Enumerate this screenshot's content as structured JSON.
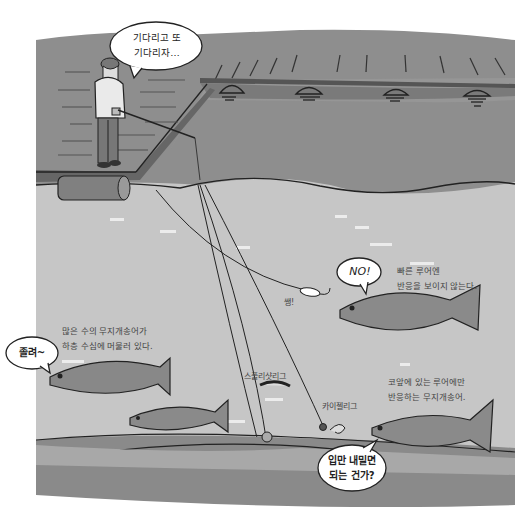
{
  "illustration": {
    "title": "무지개송어 루어 낚시 일러스트",
    "colors": {
      "background": "#ffffff",
      "sky_gray": "#8e8e8e",
      "dock_surface": "#9a9a9a",
      "dock_edge": "#777777",
      "water_light": "#c4c4c4",
      "water_deep": "#888888",
      "bottom_band": "#a9a9a9",
      "line": "#2a2a2a",
      "bubble_fill": "#ffffff",
      "text": "#333333"
    },
    "speech_bubbles": {
      "angler": {
        "line1": "기다리고 또",
        "line2": "기다리자…"
      },
      "refusing_trout": "NO!",
      "sleepy_trout": "졸려~",
      "mouth_bubble": {
        "line1": "입만 내밀면",
        "line2": "되는 건가?"
      }
    },
    "captions": {
      "fast_lure": {
        "line1": "빠른 루어엔",
        "line2": "반응을 보이지 않는다."
      },
      "many_trout": {
        "line1": "많은 수의 무지개송어가",
        "line2": "하층 수심에 머물러 있다."
      },
      "nose_lure": {
        "line1": "코앞에 있는 루어에만",
        "line2": "반응하는 무지개송어."
      }
    },
    "labels": {
      "swish_sound": "쌩!",
      "split_rig": "스플리샷리그",
      "carolina_rig": "카이젤리그"
    }
  }
}
